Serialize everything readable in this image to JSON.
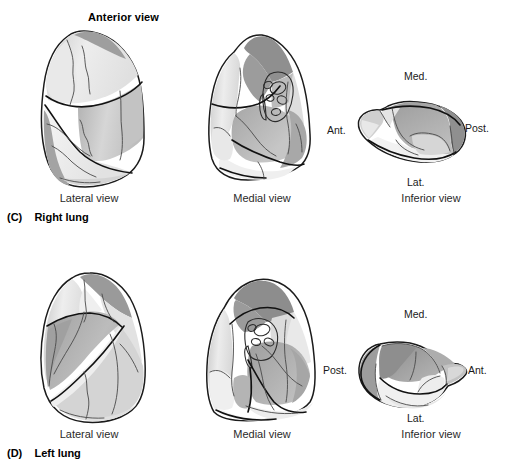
{
  "figure": {
    "title": "Anterior view",
    "rows": [
      {
        "tag": "(C)",
        "name": "Right lung",
        "panels": [
          {
            "caption": "Lateral view"
          },
          {
            "caption": "Medial view"
          },
          {
            "caption": "Inferior view",
            "orientation": {
              "top": "Med.",
              "bottom": "Lat.",
              "left": "Ant.",
              "right": "Post."
            }
          }
        ]
      },
      {
        "tag": "(D)",
        "name": "Left lung",
        "panels": [
          {
            "caption": "Lateral view"
          },
          {
            "caption": "Medial view"
          },
          {
            "caption": "Inferior view",
            "orientation": {
              "top": "Med.",
              "bottom": "Lat.",
              "left": "Post.",
              "right": "Ant."
            }
          }
        ]
      }
    ]
  },
  "palette": {
    "background": "#ffffff",
    "outline": "#1b1b1b",
    "segment_border": "#4a4a4a",
    "tone_lightest": "#f2f2f2",
    "tone_light": "#e4e4e4",
    "tone_mid": "#cfcfcf",
    "tone_medium": "#b5b5b5",
    "tone_dark": "#9a9a9a",
    "tone_darkest": "#8a8a8a",
    "text": "#1a1a1a"
  }
}
